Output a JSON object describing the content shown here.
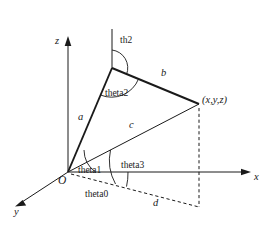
{
  "figure": {
    "background": "#ffffff",
    "stroke_color": "#1a1a1a",
    "axes": [
      {
        "name": "z-axis",
        "label": "z",
        "direction": "up",
        "label_x": 55,
        "label_y": 42
      },
      {
        "name": "x-axis",
        "label": "x",
        "direction": "right",
        "label_x": 254,
        "label_y": 177
      },
      {
        "name": "y-axis",
        "label": "y",
        "direction": "down-left",
        "label_x": 14,
        "label_y": 212
      }
    ],
    "points": [
      {
        "name": "origin",
        "label": "O",
        "x": 68,
        "y": 172,
        "label_x": 61,
        "label_y": 182
      },
      {
        "name": "elbow",
        "label": "",
        "x": 112,
        "y": 68
      },
      {
        "name": "end-effector",
        "label": "(x,y,z)",
        "x": 199,
        "y": 104,
        "label_x": 203,
        "label_y": 101
      }
    ],
    "segments": [
      {
        "name": "segment-a",
        "label": "a",
        "from": "origin",
        "to": "elbow",
        "label_x": 80,
        "label_y": 118
      },
      {
        "name": "segment-b",
        "label": "b",
        "from": "elbow",
        "to": "end-effector",
        "label_x": 163,
        "label_y": 74
      },
      {
        "name": "segment-c",
        "label": "c",
        "from": "origin",
        "to": "end-effector",
        "label_x": 131,
        "label_y": 126
      },
      {
        "name": "segment-d",
        "label": "d",
        "from": "origin",
        "to": "ground-projection",
        "label_x": 155,
        "label_y": 204,
        "style": "dashed"
      }
    ],
    "angles": [
      {
        "name": "theta0",
        "label": "theta0",
        "label_x": 88,
        "label_y": 196,
        "vertex": "origin",
        "between": "x-axis and d"
      },
      {
        "name": "theta1",
        "label": "theta1",
        "label_x": 80,
        "label_y": 173,
        "vertex": "origin",
        "between": "d and a"
      },
      {
        "name": "theta2",
        "label": "theta2",
        "label_x": 107,
        "label_y": 96,
        "vertex": "elbow",
        "between": "a and b"
      },
      {
        "name": "theta3",
        "label": "theta3",
        "label_x": 124,
        "label_y": 168,
        "vertex": "origin",
        "between": "d and c"
      },
      {
        "name": "th2",
        "label": "th2",
        "label_x": 121,
        "label_y": 42,
        "vertex": "elbow",
        "between": "vertical and b"
      }
    ],
    "dashed_elements": [
      "ground-projection-line-from-origin",
      "vertical-drop-from-end-effector",
      "ground-rectangle-edge"
    ]
  }
}
